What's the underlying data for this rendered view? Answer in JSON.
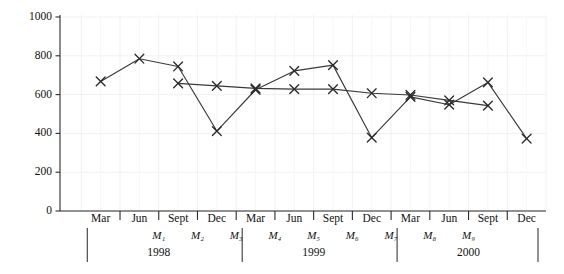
{
  "chart_data": {
    "type": "line",
    "title": "",
    "subtitle": "",
    "xlabel": "",
    "ylabel": "",
    "ylim": [
      0,
      1000
    ],
    "ytick_values": [
      0,
      200,
      400,
      600,
      800,
      1000
    ],
    "ytick_labels": [
      "0",
      "200",
      "400",
      "600",
      "800",
      "1000"
    ],
    "grid": true,
    "legend": "none",
    "categories": [
      "Mar",
      "Jun",
      "Sept",
      "Dec",
      "Mar",
      "Jun",
      "Sept",
      "Dec",
      "Mar",
      "Jun",
      "Sept",
      "Dec"
    ],
    "quarter_index": [
      0,
      1,
      2,
      3,
      4,
      5,
      6,
      7,
      8,
      9,
      10,
      11
    ],
    "series": [
      {
        "name": "series-a",
        "marker": "x",
        "x": [
          0,
          1,
          2,
          3,
          4,
          5,
          6,
          7,
          8,
          9,
          10,
          11
        ],
        "values": [
          668,
          785,
          745,
          412,
          625,
          722,
          752,
          378,
          588,
          548,
          663,
          373
        ]
      },
      {
        "name": "series-b",
        "marker": "x",
        "x": [
          2,
          3,
          4,
          5,
          6,
          7,
          8,
          9,
          10
        ],
        "values": [
          658,
          645,
          632,
          628,
          628,
          607,
          598,
          570,
          543
        ]
      }
    ],
    "period_markers": [
      "M1",
      "M2",
      "M3",
      "M4",
      "M5",
      "M6",
      "M7",
      "M8",
      "M9"
    ],
    "period_marker_labels": [
      "M₁",
      "M₂",
      "M₃",
      "M₄",
      "M₅",
      "M₆",
      "M₇",
      "M₈",
      "M₉"
    ],
    "year_groups": [
      {
        "label": "1998",
        "start_quarter": 0,
        "end_quarter": 3
      },
      {
        "label": "1999",
        "start_quarter": 4,
        "end_quarter": 7
      },
      {
        "label": "2000",
        "start_quarter": 8,
        "end_quarter": 11
      }
    ],
    "colors": {
      "line": "#3a3a3a",
      "marker": "#2b2b2b",
      "axis": "#2b2b2b",
      "grid": "#f3f0f0",
      "background": "#ffffff",
      "text": "#111111"
    }
  }
}
